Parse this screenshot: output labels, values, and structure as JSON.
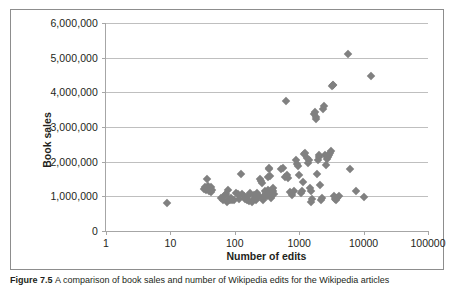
{
  "figure": {
    "caption_label": "Figure 7.5",
    "caption_text": "A comparison of book sales and number of Wikipedia edits for the Wikipedia articles"
  },
  "chart_data": {
    "type": "scatter",
    "title": "",
    "xlabel": "Number of edits",
    "ylabel": "Book sales",
    "xscale": "log",
    "yscale": "linear",
    "xlim": [
      1,
      100000
    ],
    "ylim": [
      0,
      6000000
    ],
    "grid": "horizontal",
    "legend": "none",
    "marker": "diamond",
    "marker_color": "#808080",
    "xticks": [
      1,
      10,
      100,
      1000,
      10000,
      100000
    ],
    "xtick_labels": [
      "1",
      "10",
      "100",
      "1000",
      "10000",
      "100000"
    ],
    "yticks": [
      0,
      1000000,
      2000000,
      3000000,
      4000000,
      5000000,
      6000000
    ],
    "ytick_labels": [
      "0",
      "1,000,000",
      "2,000,000",
      "3,000,000",
      "4,000,000",
      "5,000,000",
      "6,000,000"
    ],
    "series": [
      {
        "name": "Wikipedia articles",
        "points": [
          [
            9,
            820000
          ],
          [
            33,
            1210000
          ],
          [
            35,
            1260000
          ],
          [
            36,
            1180000
          ],
          [
            37,
            1500000
          ],
          [
            38,
            1230000
          ],
          [
            39,
            1290000
          ],
          [
            40,
            1150000
          ],
          [
            41,
            1200000
          ],
          [
            42,
            1260000
          ],
          [
            43,
            1120000
          ],
          [
            45,
            1180000
          ],
          [
            62,
            960000
          ],
          [
            66,
            900000
          ],
          [
            70,
            1040000
          ],
          [
            72,
            1070000
          ],
          [
            75,
            830000
          ],
          [
            78,
            1180000
          ],
          [
            80,
            930000
          ],
          [
            84,
            900000
          ],
          [
            88,
            960000
          ],
          [
            92,
            880000
          ],
          [
            96,
            900000
          ],
          [
            105,
            1110000
          ],
          [
            112,
            1060000
          ],
          [
            118,
            920000
          ],
          [
            125,
            1640000
          ],
          [
            130,
            1080000
          ],
          [
            138,
            1020000
          ],
          [
            145,
            930000
          ],
          [
            152,
            880000
          ],
          [
            160,
            1000000
          ],
          [
            168,
            860000
          ],
          [
            175,
            1100000
          ],
          [
            182,
            840000
          ],
          [
            190,
            900000
          ],
          [
            198,
            1030000
          ],
          [
            205,
            960000
          ],
          [
            215,
            880000
          ],
          [
            225,
            1090000
          ],
          [
            235,
            1020000
          ],
          [
            245,
            1500000
          ],
          [
            255,
            1430000
          ],
          [
            262,
            1380000
          ],
          [
            270,
            960000
          ],
          [
            278,
            880000
          ],
          [
            285,
            1020000
          ],
          [
            292,
            1140000
          ],
          [
            300,
            1100000
          ],
          [
            308,
            1060000
          ],
          [
            316,
            1010000
          ],
          [
            322,
            1180000
          ],
          [
            330,
            1560000
          ],
          [
            336,
            1820000
          ],
          [
            342,
            1790000
          ],
          [
            348,
            1600000
          ],
          [
            352,
            1090000
          ],
          [
            358,
            1000000
          ],
          [
            364,
            960000
          ],
          [
            370,
            1080000
          ],
          [
            376,
            1180000
          ],
          [
            382,
            1120000
          ],
          [
            390,
            1240000
          ],
          [
            398,
            1150000
          ],
          [
            405,
            1080000
          ],
          [
            520,
            1780000
          ],
          [
            560,
            1820000
          ],
          [
            600,
            1560000
          ],
          [
            620,
            3760000
          ],
          [
            650,
            1620000
          ],
          [
            680,
            1540000
          ],
          [
            720,
            1120000
          ],
          [
            760,
            1030000
          ],
          [
            820,
            1160000
          ],
          [
            880,
            2060000
          ],
          [
            920,
            1920000
          ],
          [
            960,
            1880000
          ],
          [
            1000,
            1620000
          ],
          [
            1050,
            1100000
          ],
          [
            1100,
            1160000
          ],
          [
            1150,
            1420000
          ],
          [
            1200,
            2220000
          ],
          [
            1250,
            2260000
          ],
          [
            1300,
            2100000
          ],
          [
            1350,
            1960000
          ],
          [
            1400,
            2050000
          ],
          [
            1450,
            1240000
          ],
          [
            1500,
            1160000
          ],
          [
            1550,
            840000
          ],
          [
            1600,
            920000
          ],
          [
            1700,
            3380000
          ],
          [
            1750,
            3420000
          ],
          [
            1800,
            3300000
          ],
          [
            1850,
            3240000
          ],
          [
            1900,
            1640000
          ],
          [
            1950,
            2060000
          ],
          [
            2000,
            2140000
          ],
          [
            2050,
            2180000
          ],
          [
            2100,
            1320000
          ],
          [
            2150,
            900000
          ],
          [
            2250,
            950000
          ],
          [
            2350,
            3520000
          ],
          [
            2450,
            3600000
          ],
          [
            2500,
            2180000
          ],
          [
            2600,
            1900000
          ],
          [
            2700,
            2080000
          ],
          [
            2800,
            2140000
          ],
          [
            2900,
            2200000
          ],
          [
            3000,
            2260000
          ],
          [
            3100,
            2300000
          ],
          [
            3200,
            4180000
          ],
          [
            3300,
            4200000
          ],
          [
            3400,
            4220000
          ],
          [
            3500,
            1020000
          ],
          [
            3600,
            930000
          ],
          [
            3700,
            880000
          ],
          [
            3900,
            960000
          ],
          [
            4100,
            1000000
          ],
          [
            5800,
            5120000
          ],
          [
            6200,
            1780000
          ],
          [
            7600,
            1150000
          ],
          [
            10200,
            970000
          ],
          [
            13000,
            4480000
          ]
        ]
      }
    ]
  }
}
